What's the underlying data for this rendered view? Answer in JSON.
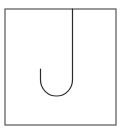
{
  "figure": {
    "frame": {
      "x": 5,
      "y": 9,
      "width": 111,
      "height": 116,
      "stroke": "#555555",
      "stroke_width": 1.2
    },
    "hook": {
      "path": "M 72.5 9 L 72.5 80 A 16 16 0 0 1 40.5 80 L 40.5 69",
      "stroke": "#2a2a2a",
      "stroke_width": 1.2
    }
  }
}
